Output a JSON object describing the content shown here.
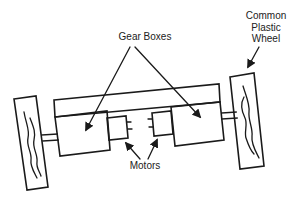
{
  "diagram": {
    "labels": {
      "gear_boxes": "Gear Boxes",
      "motors": "Motors",
      "wheel_line1": "Common",
      "wheel_line2": "Plastic",
      "wheel_line3": "Wheel"
    },
    "components": [
      "frame",
      "left-gearbox",
      "right-gearbox",
      "left-motor",
      "right-motor",
      "left-wheel",
      "right-wheel",
      "left-axle",
      "right-axle"
    ],
    "colors": {
      "line": "#1a1a1a",
      "text": "#222222",
      "background": "#ffffff"
    }
  }
}
